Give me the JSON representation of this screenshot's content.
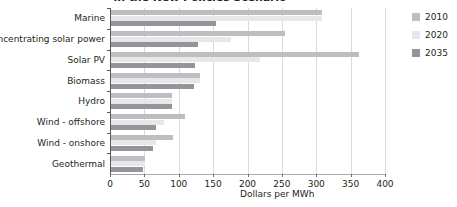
{
  "chart_data": {
    "type": "bar",
    "orientation": "horizontal",
    "title": "in the New Policies Scenario",
    "xlabel": "Dollars per MWh",
    "ylabel": "",
    "xlim": [
      0,
      400
    ],
    "xticks": [
      0,
      50,
      100,
      150,
      200,
      250,
      300,
      350,
      400
    ],
    "xtick_labels": [
      "0",
      "50",
      "100",
      "150",
      "200",
      "250",
      "300",
      "350",
      "400"
    ],
    "grid": true,
    "grid_axis": "x",
    "legend_position": "right",
    "categories": [
      "Marine",
      "Concentrating solar power",
      "Solar PV",
      "Biomass",
      "Hydro",
      "Wind - offshore",
      "Wind - onshore",
      "Geothermal"
    ],
    "series": [
      {
        "name": "2010",
        "color": "#bcbec0",
        "values": [
          307,
          253,
          360,
          129,
          88,
          107,
          90,
          49
        ]
      },
      {
        "name": "2020",
        "color": "#e6e7e8",
        "values": [
          307,
          175,
          217,
          129,
          88,
          77,
          66,
          49
        ]
      },
      {
        "name": "2035",
        "color": "#939598",
        "values": [
          153,
          127,
          122,
          120,
          88,
          65,
          61,
          47
        ]
      }
    ]
  },
  "legend": {
    "items": [
      {
        "label": "2010",
        "color": "#bcbec0"
      },
      {
        "label": "2020",
        "color": "#e6e7e8"
      },
      {
        "label": "2035",
        "color": "#939598"
      }
    ]
  },
  "axis": {
    "x_title": "Dollars per MWh"
  },
  "colors": {
    "axis": "#58595b",
    "grid": "#d9dadb",
    "text": "#231f20",
    "background": "#ffffff"
  }
}
